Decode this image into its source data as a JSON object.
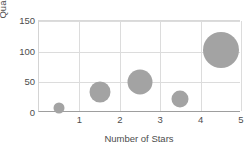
{
  "chart_data": {
    "type": "scatter",
    "subtype": "bubble",
    "title": "",
    "xlabel": "Number of Stars",
    "ylabel": "Quantity Sold",
    "x": [
      1,
      2,
      3,
      4,
      5
    ],
    "y": [
      8,
      35,
      50,
      23,
      102
    ],
    "sizes": [
      11,
      21,
      25,
      17,
      36
    ],
    "xticks": [
      "1",
      "2",
      "3",
      "4",
      "5"
    ],
    "yticks": [
      "0",
      "50",
      "100",
      "150"
    ],
    "ytick_values": [
      0,
      50,
      100,
      150
    ],
    "xlim": [
      0.5,
      5.5
    ],
    "ylim": [
      0,
      150
    ],
    "grid": true,
    "legend": "none",
    "series_color": "#a3a3a3",
    "points": [
      {
        "label": "1 star",
        "x": 1,
        "y": 8,
        "size": 11
      },
      {
        "label": "2 stars",
        "x": 2,
        "y": 35,
        "size": 21
      },
      {
        "label": "3 stars",
        "x": 3,
        "y": 50,
        "size": 25
      },
      {
        "label": "4 stars",
        "x": 4,
        "y": 23,
        "size": 17
      },
      {
        "label": "5 stars",
        "x": 5,
        "y": 102,
        "size": 36
      }
    ]
  }
}
